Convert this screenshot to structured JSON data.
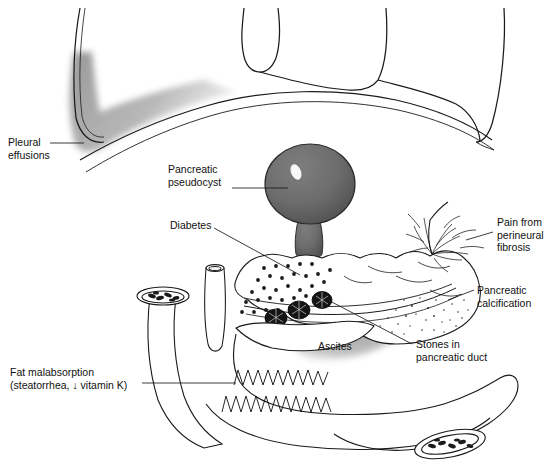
{
  "figure": {
    "width": 551,
    "height": 467,
    "background": "#ffffff",
    "line_color": "#1a1a1a",
    "text_color": "#111111"
  },
  "palette": {
    "pseudocyst_fill": "#6d6d6d",
    "pseudocyst_shade": "#555555",
    "pseudocyst_highlight": "#ffffff",
    "effusion_gray": "#9a9a9a",
    "ascites_gray": "#9a9a9a",
    "stone_fill": "#141414",
    "stipple_dot": "#1a1a1a",
    "outline": "#1a1a1a"
  },
  "labels": [
    {
      "id": "pleural-effusions",
      "line1": "Pleural",
      "line2": "effusions",
      "x": 8,
      "y": 136,
      "align": "left"
    },
    {
      "id": "pancreatic-pseudocyst",
      "line1": "Pancreatic",
      "line2": "pseudocyst",
      "x": 168,
      "y": 163,
      "align": "left"
    },
    {
      "id": "diabetes",
      "line1": "Diabetes",
      "line2": "",
      "x": 170,
      "y": 219,
      "align": "left"
    },
    {
      "id": "pain-perineural-fibrosis",
      "line1": "Pain from",
      "line2": "perineural",
      "line3": "fibrosis",
      "x": 497,
      "y": 216,
      "align": "left"
    },
    {
      "id": "pancreatic-calcification",
      "line1": "Pancreatic",
      "line2": "calcification",
      "x": 477,
      "y": 284,
      "align": "left"
    },
    {
      "id": "stones-pancreatic-duct",
      "line1": "Stones in",
      "line2": "pancreatic duct",
      "x": 416,
      "y": 338,
      "align": "left"
    },
    {
      "id": "ascites",
      "line1": "Ascites",
      "line2": "",
      "x": 318,
      "y": 340,
      "align": "left"
    },
    {
      "id": "fat-malabsorption",
      "line1": "Fat malabsorption",
      "line2": "(steatorrhea, ↓ vitamin K)",
      "x": 10,
      "y": 366,
      "align": "left"
    }
  ],
  "structures": {
    "thorax": "rib-cage-and-diaphragm",
    "pleural_effusion": "left-costophrenic-gray-shading",
    "pseudocyst": "balloon-on-stalk-above-pancreas",
    "pancreas": "body-and-tail-with-stippling",
    "islet_dots": "diabetes-dot-field",
    "pancreatic_duct": "main-duct-with-three-stones",
    "stones_count": 3,
    "nerve_plexus": "perineural-fibrosis-splay",
    "duodenum": "c-loop-with-valvulae",
    "jejunum_cut": "cut-bowel-cross-section",
    "ascites_shading": "gray-fluid-below-pancreas"
  }
}
